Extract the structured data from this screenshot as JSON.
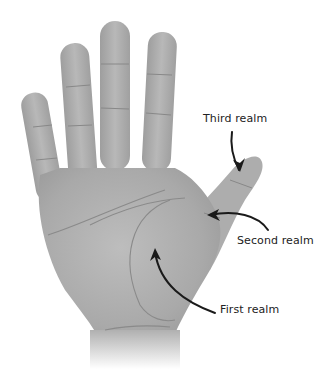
{
  "diagram": {
    "labels": [
      {
        "id": "third",
        "text": "Third realm",
        "x": 203,
        "y": 112
      },
      {
        "id": "second",
        "text": "Second realm",
        "x": 237,
        "y": 234
      },
      {
        "id": "first",
        "text": "First realm",
        "x": 220,
        "y": 303
      }
    ],
    "colors": {
      "skin": "#a8a8a8",
      "skin_light": "#c4c4c4",
      "crease": "#7e7e7e",
      "arrow": "#1a1a1a",
      "background": "#ffffff"
    }
  }
}
